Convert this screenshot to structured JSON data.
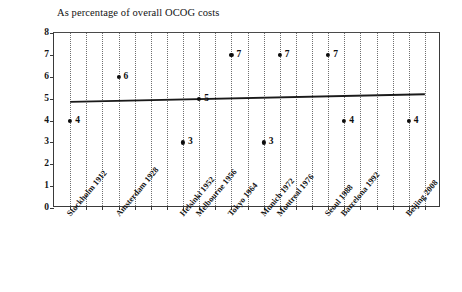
{
  "chart_data": {
    "type": "scatter",
    "title": "As percentage of overall OCOG costs",
    "xlabel": "",
    "ylabel": "",
    "ylim": [
      0,
      8
    ],
    "yticks": [
      0,
      1,
      2,
      3,
      4,
      5,
      6,
      7,
      8
    ],
    "grid": true,
    "legend": false,
    "categories": [
      "Stockholm 1912",
      "Antwerp 1920",
      "Paris 1924",
      "Amsterdam 1928",
      "Los Angeles 1932",
      "Berlin 1936",
      "London 1948",
      "Helsinki 1952",
      "Melbourne 1956",
      "Rome 1960",
      "Tokyo 1964",
      "Mexico City 1968",
      "Munich 1972",
      "Montreal 1976",
      "Moscow 1980",
      "Los Angeles 1984",
      "Seoul 1988",
      "Barcelona 1992",
      "Atlanta 1996",
      "Sydney 2000",
      "Athens 2004",
      "Beijing 2008",
      "London 2012"
    ],
    "visible_tick_labels": [
      "Stockholm 1912",
      "Amsterdam 1928",
      "Helsinki 1952",
      "Melbourne 1956",
      "Tokyo 1964",
      "Munich 1972",
      "Montreal 1976",
      "Seoul 1988",
      "Barcelona 1992",
      "Beijing 2008"
    ],
    "points": [
      {
        "category": "Stockholm 1912",
        "index": 0,
        "value": 4,
        "label": "4"
      },
      {
        "category": "Amsterdam 1928",
        "index": 3,
        "value": 6,
        "label": "6"
      },
      {
        "category": "Helsinki 1952",
        "index": 7,
        "value": 3,
        "label": "3"
      },
      {
        "category": "Melbourne 1956",
        "index": 8,
        "value": 5,
        "label": "5"
      },
      {
        "category": "Tokyo 1964",
        "index": 10,
        "value": 7,
        "label": "7"
      },
      {
        "category": "Munich 1972",
        "index": 12,
        "value": 3,
        "label": "3"
      },
      {
        "category": "Montreal 1976",
        "index": 13,
        "value": 7,
        "label": "7"
      },
      {
        "category": "Seoul 1988",
        "index": 16,
        "value": 7,
        "label": "7"
      },
      {
        "category": "Barcelona 1992",
        "index": 17,
        "value": 4,
        "label": "4"
      },
      {
        "category": "Beijing 2008",
        "index": 21,
        "value": 4,
        "label": "4"
      }
    ],
    "trendline": {
      "type": "linear",
      "start_value": 4.85,
      "end_value": 5.2,
      "color": "#1a1a1a"
    },
    "colors": {
      "point": "#0c0c0c",
      "axis": "#3a3a3a",
      "grid": "#6f6f6f",
      "text": "#141414"
    }
  }
}
